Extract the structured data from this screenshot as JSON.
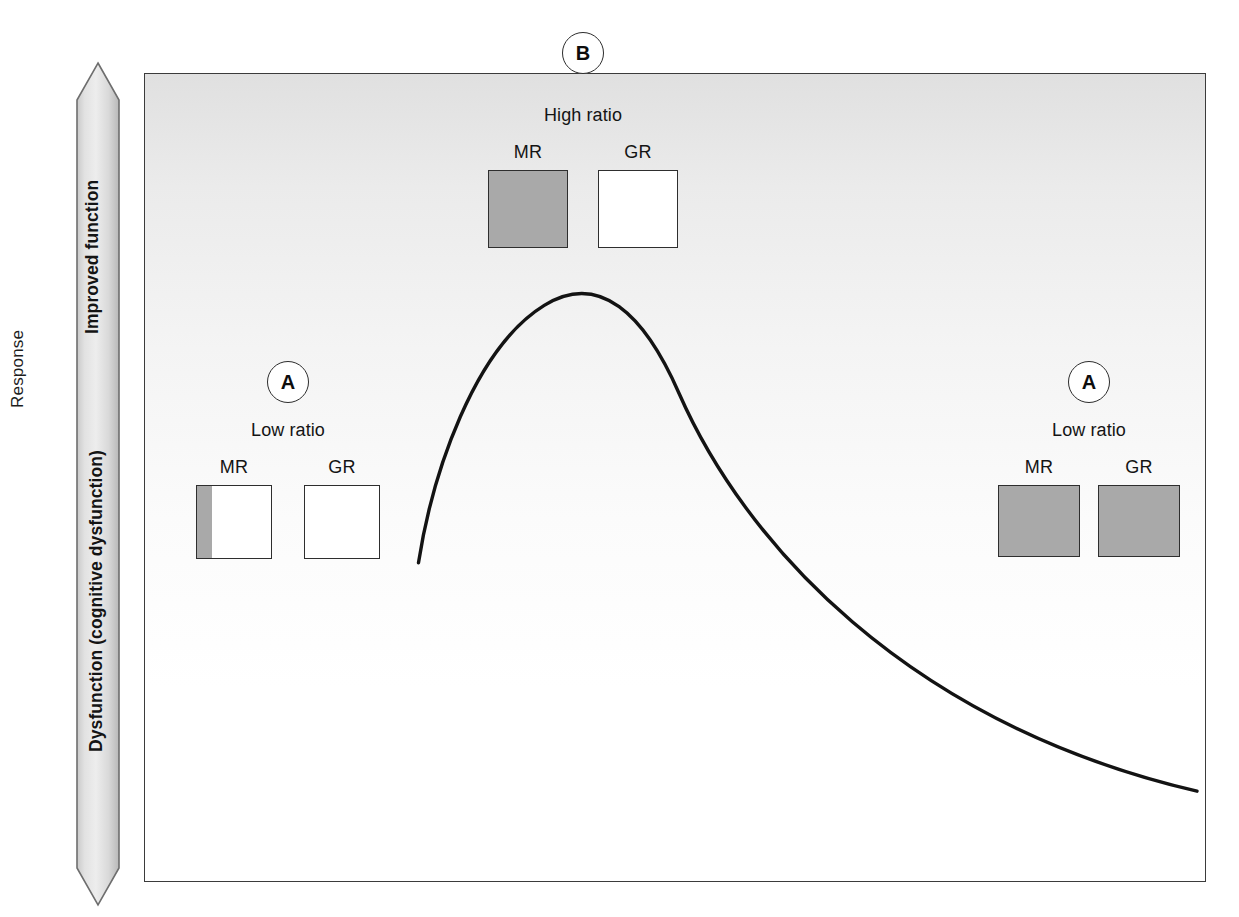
{
  "figure": {
    "y_axis_title": "Response",
    "arrow": {
      "upper_label": "Improved function",
      "lower_label": "Dysfunction (cognitive dysfunction)"
    }
  },
  "panels": [
    {
      "id": "left",
      "marker": "A",
      "title": "Low ratio",
      "receptors": [
        {
          "label": "MR",
          "fill_percent": 20
        },
        {
          "label": "GR",
          "fill_percent": 0
        }
      ]
    },
    {
      "id": "top",
      "marker": "B",
      "title": "High ratio",
      "receptors": [
        {
          "label": "MR",
          "fill_percent": 100
        },
        {
          "label": "GR",
          "fill_percent": 0
        }
      ]
    },
    {
      "id": "right",
      "marker": "A",
      "title": "Low ratio",
      "receptors": [
        {
          "label": "MR",
          "fill_percent": 100
        },
        {
          "label": "GR",
          "fill_percent": 100
        }
      ]
    }
  ],
  "colors": {
    "fill_gray": "#a9a9a9",
    "stroke": "#2e2e2e",
    "curve": "#131313"
  },
  "chart_data": {
    "type": "line",
    "title": "",
    "xlabel": "",
    "ylabel": "Response",
    "grid": false,
    "legend": "none",
    "y_axis_annotations": [
      "Improved function",
      "Dysfunction (cognitive dysfunction)"
    ],
    "curve_description": "Inverted-U dose-response curve: steep rise to a peak then gradual decline",
    "x": [
      0.0,
      0.05,
      0.1,
      0.15,
      0.2,
      0.26,
      0.33,
      0.41,
      0.5,
      0.6,
      0.7,
      0.8,
      0.9,
      1.0
    ],
    "y": [
      0.4,
      0.57,
      0.7,
      0.8,
      0.87,
      0.92,
      0.94,
      0.92,
      0.86,
      0.76,
      0.64,
      0.5,
      0.35,
      0.2
    ],
    "peak_x": 0.33,
    "peak_y": 0.94,
    "xlim": [
      0,
      1
    ],
    "ylim": [
      0,
      1
    ],
    "annotations": [
      {
        "label": "A",
        "text": "Low ratio",
        "x": 0.135,
        "y": 0.86,
        "meaning": "low MR:GR ratio at low end of curve"
      },
      {
        "label": "B",
        "text": "High ratio",
        "x": 0.41,
        "y": 1.0,
        "meaning": "high MR:GR ratio at curve peak"
      },
      {
        "label": "A",
        "text": "Low ratio",
        "x": 0.89,
        "y": 0.86,
        "meaning": "low MR:GR ratio at high end of curve"
      }
    ]
  }
}
